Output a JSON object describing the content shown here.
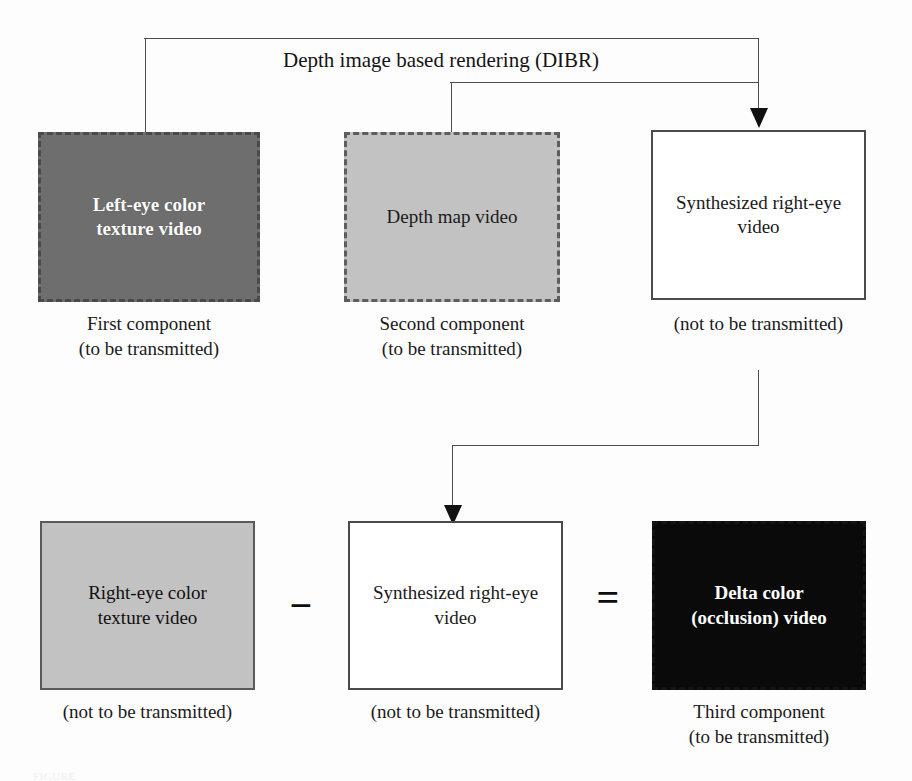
{
  "figure": {
    "flow_label": "Depth image based rendering (DIBR)",
    "caption": "FIGURE"
  },
  "top_row": {
    "boxes": [
      {
        "id": "left-eye-color-texture-video",
        "label": "Left-eye color\ntexture video",
        "caption": "First component\n(to be transmitted)",
        "fill": "#6e6e6e",
        "border_style": "dashed",
        "text_color": "#ffffff"
      },
      {
        "id": "depth-map-video",
        "label": "Depth map video",
        "caption": "Second component\n(to be transmitted)",
        "fill": "#c2c2c2",
        "border_style": "dashed",
        "text_color": "#1a1a1a"
      },
      {
        "id": "synthesized-right-eye-video",
        "label": "Synthesized right-eye\nvideo",
        "caption": "(not to be transmitted)",
        "fill": "#ffffff",
        "border_style": "solid",
        "text_color": "#1a1a1a"
      }
    ]
  },
  "bottom_row": {
    "boxes": [
      {
        "id": "right-eye-color-texture-video",
        "label": "Right-eye color\ntexture video",
        "caption": "(not to be transmitted)",
        "fill": "#c2c2c2",
        "border_style": "solid",
        "text_color": "#101010"
      },
      {
        "id": "synthesized-right-eye-video-2",
        "label": "Synthesized right-eye\nvideo",
        "caption": "(not to be transmitted)",
        "fill": "#ffffff",
        "border_style": "solid",
        "text_color": "#1a1a1a"
      },
      {
        "id": "delta-color-occlusion-video",
        "label": "Delta color\n(occlusion) video",
        "caption": "Third component\n(to be transmitted)",
        "fill": "#0a0a0a",
        "border_style": "dashed",
        "text_color": "#ffffff"
      }
    ],
    "operators": {
      "minus": "−",
      "equals": "="
    }
  },
  "colors": {
    "line": "#4d4d4d",
    "arrow": "#111111",
    "page_background": "#fdfdfd"
  }
}
